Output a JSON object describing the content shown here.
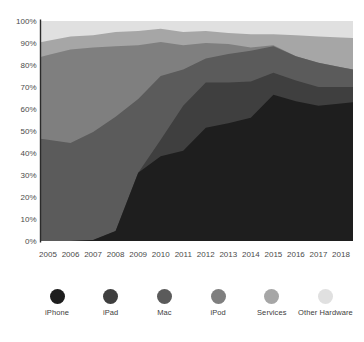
{
  "colors": {
    "background": "#ffffff",
    "text": "#4a4a4a",
    "axis": "#2b2b2b"
  },
  "chart_data": {
    "type": "area",
    "stacked": true,
    "percent": true,
    "title": "",
    "xlabel": "",
    "ylabel": "",
    "ylim": [
      0,
      100
    ],
    "grid": false,
    "legend_position": "bottom",
    "x": [
      2005,
      2006,
      2007,
      2008,
      2009,
      2010,
      2011,
      2012,
      2013,
      2014,
      2015,
      2016,
      2017,
      2018
    ],
    "x_tick_labels": [
      "2005",
      "2006",
      "2007",
      "2008",
      "2009",
      "2010",
      "2011",
      "2012",
      "2013",
      "2014",
      "2015",
      "2016",
      "2017",
      "2018"
    ],
    "y_tick_labels": [
      "0%",
      "10%",
      "20%",
      "30%",
      "40%",
      "50%",
      "60%",
      "70%",
      "80%",
      "90%",
      "100%"
    ],
    "series": [
      {
        "name": "iPhone",
        "color": "#1e1e1e",
        "values": [
          0,
          0,
          0.5,
          4.5,
          31,
          38.5,
          41,
          51.5,
          53.5,
          56,
          66.5,
          63.5,
          61.5,
          62.5
        ]
      },
      {
        "name": "iPad",
        "color": "#3f3f3f",
        "values": [
          0,
          0,
          0,
          0,
          0,
          7.5,
          20.5,
          20.5,
          18.5,
          16.5,
          10,
          9.5,
          8.5,
          7.5
        ]
      },
      {
        "name": "Mac",
        "color": "#5b5b5b",
        "values": [
          46,
          44.5,
          49,
          52,
          33.5,
          29,
          16.5,
          11,
          13,
          14,
          12,
          11,
          11,
          9
        ]
      },
      {
        "name": "iPod",
        "color": "#7f7f7f",
        "values": [
          38.5,
          42.5,
          38.5,
          32,
          24.5,
          15.5,
          11,
          7,
          4.5,
          1.5,
          0.5,
          0,
          0,
          0
        ]
      },
      {
        "name": "Services",
        "color": "#a6a6a6",
        "values": [
          6.5,
          6,
          5.5,
          6.5,
          6.5,
          6,
          6,
          5.5,
          5,
          6,
          5,
          9.5,
          12,
          13.5
        ]
      },
      {
        "name": "Other Hardware",
        "color": "#e0e0e0",
        "values": [
          9,
          7,
          6.5,
          5,
          4.5,
          3.5,
          5,
          4.5,
          5.5,
          6,
          6,
          6.5,
          7,
          7.5
        ]
      }
    ]
  }
}
